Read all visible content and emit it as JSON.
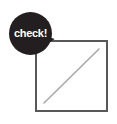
{
  "canvas": {
    "width": 117,
    "height": 124,
    "background": "#ffffff"
  },
  "annotation": {
    "type": "speech-bubble",
    "label": "check!",
    "fill_color": "#231f20",
    "text_color": "#ffffff",
    "shape": "circle-with-tail",
    "tail_direction": "down-right"
  },
  "diagram": {
    "shape": "square",
    "border_color": "#58585a",
    "border_width_px": 2,
    "fill_color": "#ffffff",
    "line": {
      "description": "diagonal",
      "color": "#a7a9ac",
      "width_px": 1.5,
      "from": "bottom-left",
      "to": "top-right"
    }
  }
}
